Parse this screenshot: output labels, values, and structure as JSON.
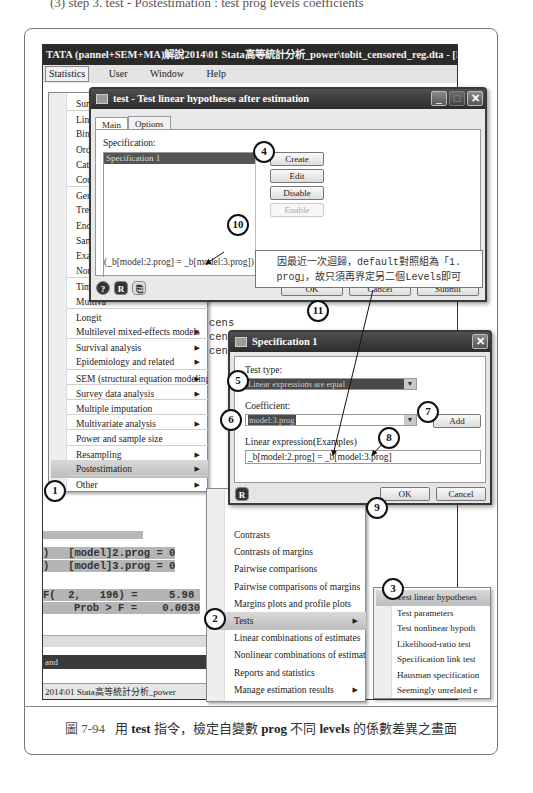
{
  "top_cut_text": "(3) step 3. test - Postestimation : test prog levels coefficients",
  "stata_window": {
    "title": "TATA (pannel+SEM+MA)解說2014\\01 Stata高等統計分析_power\\tobit_censored_reg.dta - [Results]",
    "menubar": [
      "Statistics",
      "User",
      "Window",
      "Help"
    ],
    "results": {
      "line_272": "272",
      "cens_lines": [
        "cens",
        "cen",
        "cen"
      ],
      "constraints": [
        {
          "prefix": ")",
          "text": "[model]2.prog = 0"
        },
        {
          "prefix": ")",
          "text": "[model]3.prog = 0"
        }
      ],
      "f_stat_line": "F(  2,   196) =     5.98",
      "prob_line": "Prob > F =    0.0030",
      "dark_bar_text": "and",
      "status_path": "2014\\01 Stata高等統計分析_power"
    }
  },
  "statistics_menu": {
    "items": [
      {
        "label": "Summa",
        "arrow": false,
        "sep": false
      },
      {
        "label": "Linear",
        "arrow": false,
        "sep": true
      },
      {
        "label": "Binary",
        "arrow": false,
        "sep": false
      },
      {
        "label": "Ordina",
        "arrow": false,
        "sep": false
      },
      {
        "label": "Catego",
        "arrow": false,
        "sep": false
      },
      {
        "label": "Count",
        "arrow": false,
        "sep": false
      },
      {
        "label": "Genera",
        "arrow": false,
        "sep": true
      },
      {
        "label": "Treatm",
        "arrow": false,
        "sep": false
      },
      {
        "label": "Endoge",
        "arrow": false,
        "sep": false
      },
      {
        "label": "Sample",
        "arrow": false,
        "sep": false
      },
      {
        "label": "Exact s",
        "arrow": false,
        "sep": false
      },
      {
        "label": "Nonpa",
        "arrow": false,
        "sep": false
      },
      {
        "label": "Time s",
        "arrow": false,
        "sep": true
      },
      {
        "label": "Multiva",
        "arrow": false,
        "sep": false
      },
      {
        "label": "Longit",
        "arrow": false,
        "sep": true
      },
      {
        "label": "Multilevel mixed-effects models",
        "arrow": true,
        "sep": false
      },
      {
        "label": "Survival analysis",
        "arrow": true,
        "sep": true
      },
      {
        "label": "Epidemiology and related",
        "arrow": true,
        "sep": false
      },
      {
        "label": "SEM (structural equation modeling)",
        "arrow": true,
        "sep": true
      },
      {
        "label": "Survey data analysis",
        "arrow": true,
        "sep": true
      },
      {
        "label": "Multiple imputation",
        "arrow": false,
        "sep": true
      },
      {
        "label": "Multivariate analysis",
        "arrow": true,
        "sep": true
      },
      {
        "label": "Power and sample size",
        "arrow": false,
        "sep": true
      },
      {
        "label": "Resampling",
        "arrow": true,
        "sep": true
      },
      {
        "label": "Postestimation",
        "arrow": true,
        "sep": false,
        "active": true
      },
      {
        "label": "Other",
        "arrow": true,
        "sep": true
      }
    ]
  },
  "postestimation_menu": {
    "items": [
      {
        "label": "Contrasts",
        "arrow": false
      },
      {
        "label": "Contrasts of margins",
        "arrow": false
      },
      {
        "label": "Pairwise comparisons",
        "arrow": false
      },
      {
        "label": "Pairwise comparisons of margins",
        "arrow": false
      },
      {
        "label": "Margins plots and profile plots",
        "arrow": false
      },
      {
        "label": "Tests",
        "arrow": true,
        "active": true
      },
      {
        "label": "Linear combinations of estimates",
        "arrow": false
      },
      {
        "label": "Nonlinear combinations of estimates",
        "arrow": false
      },
      {
        "label": "Reports and statistics",
        "arrow": false
      },
      {
        "label": "Manage estimation results",
        "arrow": true
      }
    ]
  },
  "tests_menu": {
    "items": [
      {
        "label": "Test linear hypotheses",
        "active": true
      },
      {
        "label": "Test parameters"
      },
      {
        "label": "Test nonlinear hypoth"
      },
      {
        "label": "Likelihood-ratio test"
      },
      {
        "label": "Specification link test"
      },
      {
        "label": "Hausman specification"
      },
      {
        "label": "Seemingly unrelated e"
      }
    ]
  },
  "test_dialog": {
    "title": "test - Test linear hypotheses after estimation",
    "tabs": [
      "Main",
      "Options"
    ],
    "specification_label": "Specification:",
    "list_items": [
      "Specification 1"
    ],
    "buttons": {
      "create": "Create",
      "edit": "Edit",
      "disable": "Disable",
      "enable": "Enable"
    },
    "expression": "(_b[model:2.prog] = _b[model:3.prog])",
    "footer_icons": [
      "help-icon",
      "reset-icon",
      "copy-icon"
    ],
    "footer_buttons": {
      "ok": "OK",
      "cancel": "Cancel",
      "submit": "Submit"
    }
  },
  "spec_dialog": {
    "title": "Specification 1",
    "test_type_label": "Test type:",
    "test_type_value": "Linear expressions are equal",
    "coefficient_label": "Coefficient:",
    "coefficient_value": "model:3.prog",
    "add_button": "Add",
    "linear_expression_label": "Linear expression:",
    "examples_label": "(Examples)",
    "linear_expression_value": "_b[model:2.prog] = _b[model:3.prog]",
    "ok": "OK",
    "cancel": "Cancel"
  },
  "callout_text_line1": "因最近一次迴歸，default對照組為「1.",
  "callout_text_line2": "prog」，故只須再界定另二個Levels即可",
  "steps": [
    "1",
    "2",
    "3",
    "4",
    "5",
    "6",
    "7",
    "8",
    "9",
    "10",
    "11"
  ],
  "caption": {
    "figure_no": "圖 7-94",
    "text_before": "用",
    "cmd": "test",
    "text_mid": "指令，檢定自變數",
    "var": "prog",
    "text_mid2": "不同",
    "levels": "levels",
    "text_after": "的係數差異之畫面"
  }
}
